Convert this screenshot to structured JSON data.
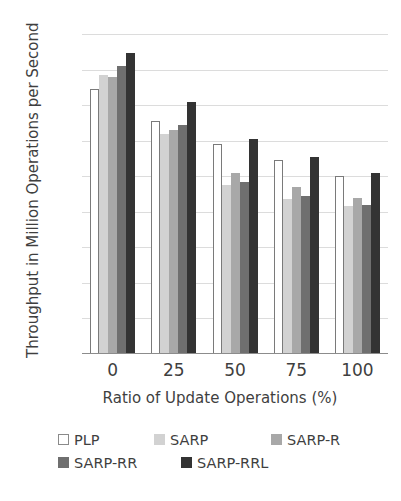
{
  "chart_data": {
    "type": "bar",
    "title": "",
    "xlabel": "Ratio of Update Operations (%)",
    "ylabel": "Throughput in Million Operations per Second",
    "categories": [
      "0",
      "25",
      "50",
      "75",
      "100"
    ],
    "ylim": [
      0,
      9
    ],
    "yticks": [
      "9",
      "8",
      "7",
      "6",
      "5",
      "4",
      "3",
      "2",
      "1",
      "0"
    ],
    "grid": true,
    "legend_position": "bottom",
    "series": [
      {
        "name": "PLP",
        "color": "#ffffff",
        "border": "#7a7a7a",
        "values": [
          7.45,
          6.55,
          5.9,
          5.45,
          5.0
        ]
      },
      {
        "name": "SARP",
        "color": "#d2d2d2",
        "border": "#d2d2d2",
        "values": [
          7.85,
          6.2,
          4.75,
          4.35,
          4.15
        ]
      },
      {
        "name": "SARP-R",
        "color": "#a8a8a8",
        "border": "#a8a8a8",
        "values": [
          7.78,
          6.3,
          5.1,
          4.7,
          4.4
        ]
      },
      {
        "name": "SARP-RR",
        "color": "#6f6f6f",
        "border": "#6f6f6f",
        "values": [
          8.1,
          6.45,
          4.85,
          4.45,
          4.2
        ]
      },
      {
        "name": "SARP-RRL",
        "color": "#333333",
        "border": "#333333",
        "values": [
          8.48,
          7.08,
          6.05,
          5.55,
          5.08
        ]
      }
    ]
  }
}
